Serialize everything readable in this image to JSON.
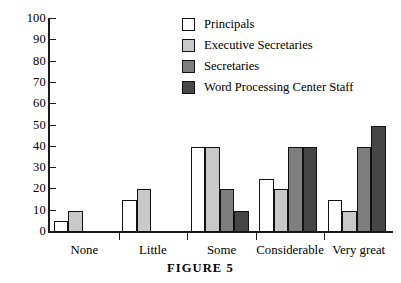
{
  "caption": "FIGURE 5",
  "legend": {
    "items": [
      {
        "label": "Principals",
        "color": "#ffffff"
      },
      {
        "label": "Executive Secretaries",
        "color": "#c9c9c9"
      },
      {
        "label": "Secretaries",
        "color": "#7e7e7e"
      },
      {
        "label": "Word Processing Center Staff",
        "color": "#464646"
      }
    ]
  },
  "chart_data": {
    "type": "bar",
    "title": "FIGURE 5",
    "xlabel": "",
    "ylabel": "",
    "ylim": [
      0,
      100
    ],
    "ytick_labels": [
      "0",
      "10",
      "20",
      "30",
      "40",
      "50",
      "60",
      "70",
      "80",
      "90",
      "100"
    ],
    "yticks": [
      0,
      10,
      20,
      30,
      40,
      50,
      60,
      70,
      80,
      90,
      100
    ],
    "grid": false,
    "legend_position": "top-right",
    "categories": [
      "None",
      "Little",
      "Some",
      "Considerable",
      "Very great"
    ],
    "series": [
      {
        "name": "Principals",
        "color": "#ffffff",
        "values": [
          5,
          15,
          40,
          25,
          15
        ]
      },
      {
        "name": "Executive Secretaries",
        "color": "#c9c9c9",
        "values": [
          10,
          20,
          40,
          20,
          10
        ]
      },
      {
        "name": "Secretaries",
        "color": "#7e7e7e",
        "values": [
          0,
          0,
          20,
          40,
          40
        ]
      },
      {
        "name": "Word Processing Center Staff",
        "color": "#464646",
        "values": [
          0,
          0,
          10,
          40,
          50
        ]
      }
    ]
  }
}
